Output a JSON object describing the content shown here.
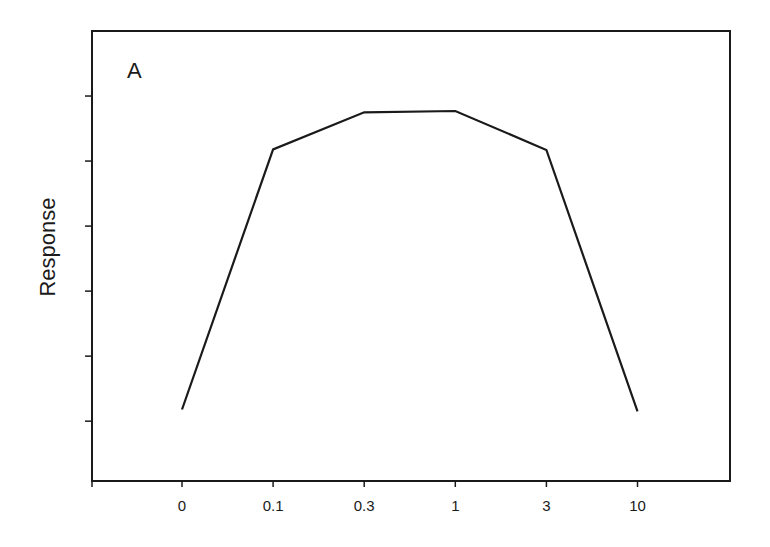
{
  "chart_data": {
    "type": "line",
    "title": "",
    "panel_label": "A",
    "xlabel": "",
    "ylabel": "Response",
    "x_scale": "categorical (log-like dose)",
    "categories": [
      "0",
      "0.1",
      "0.3",
      "1",
      "3",
      "10"
    ],
    "series": [
      {
        "name": "Response",
        "values": [
          1.18,
          5.18,
          5.75,
          5.77,
          5.17,
          1.15
        ]
      }
    ],
    "y_ticks_count": 6,
    "y_tick_labels": [],
    "ylim": [
      0.08,
      7.0
    ],
    "units": "arbitrary (no y tick labels shown)",
    "grid": false,
    "legend": null,
    "line_color": "#1a1a1a"
  }
}
